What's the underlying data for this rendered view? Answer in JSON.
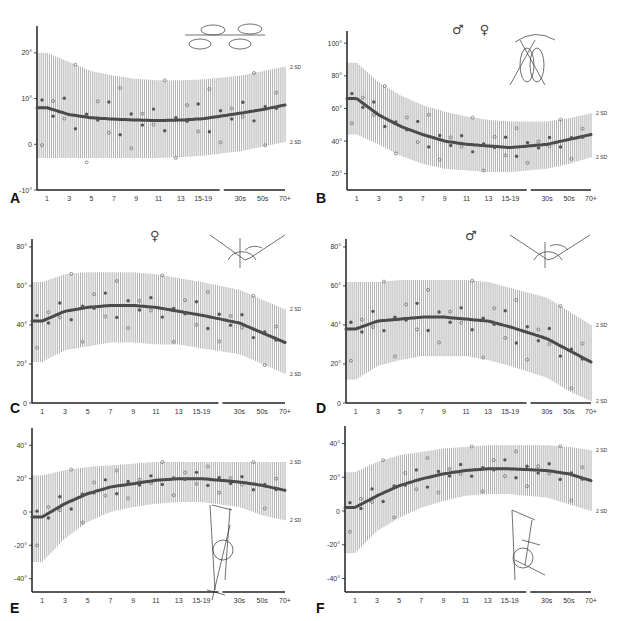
{
  "figure": {
    "x_tick_labels": [
      "1",
      "3",
      "5",
      "7",
      "9",
      "11",
      "13",
      "15-19",
      "30s",
      "50s",
      "70+"
    ],
    "sd_label": "2 SD"
  },
  "panels": [
    {
      "label": "A",
      "symbols": "",
      "illustration": "foot-progression-angle",
      "yticks": [
        {
          "v": 20,
          "t": "20°"
        },
        {
          "v": 10,
          "t": "10°"
        },
        {
          "v": 0,
          "t": "0"
        },
        {
          "v": -10,
          "t": "-10°"
        }
      ]
    },
    {
      "label": "B",
      "symbols": "♂ ♀",
      "illustration": "hip-internal-rotation",
      "yticks": [
        {
          "v": 100,
          "t": "100°"
        },
        {
          "v": 80,
          "t": "80°"
        },
        {
          "v": 60,
          "t": "60°"
        },
        {
          "v": 40,
          "t": "40°"
        },
        {
          "v": 20,
          "t": "20°"
        }
      ]
    },
    {
      "label": "C",
      "symbols": "♀",
      "illustration": "hip-external-rotation",
      "yticks": [
        {
          "v": 80,
          "t": "80°"
        },
        {
          "v": 60,
          "t": "60°"
        },
        {
          "v": 40,
          "t": "40°"
        },
        {
          "v": 20,
          "t": "20°"
        },
        {
          "v": 0,
          "t": "0"
        }
      ]
    },
    {
      "label": "D",
      "symbols": "♂",
      "illustration": "hip-external-rotation",
      "yticks": [
        {
          "v": 80,
          "t": "80°"
        },
        {
          "v": 60,
          "t": "60°"
        },
        {
          "v": 40,
          "t": "40°"
        },
        {
          "v": 20,
          "t": "20°"
        },
        {
          "v": 0,
          "t": "0"
        }
      ]
    },
    {
      "label": "E",
      "symbols": "",
      "illustration": "thigh-foot-angle",
      "yticks": [
        {
          "v": 40,
          "t": "40°"
        },
        {
          "v": 20,
          "t": "20°"
        },
        {
          "v": 0,
          "t": "0"
        },
        {
          "v": -20,
          "t": "-20°"
        },
        {
          "v": -40,
          "t": "-40°"
        }
      ]
    },
    {
      "label": "F",
      "symbols": "",
      "illustration": "transmalleolar-axis",
      "yticks": [
        {
          "v": 40,
          "t": "40°"
        },
        {
          "v": 20,
          "t": "20°"
        },
        {
          "v": 0,
          "t": "0"
        },
        {
          "v": -20,
          "t": "-20°"
        },
        {
          "v": -40,
          "t": "-40°"
        }
      ]
    }
  ],
  "chart_data": [
    {
      "type": "line",
      "title": "A",
      "xlabel": "Age (years)",
      "ylabel": "Degrees",
      "categories": [
        "1",
        "3",
        "5",
        "7",
        "9",
        "11",
        "13",
        "15-19",
        "30s",
        "50s",
        "70+"
      ],
      "ylim": [
        -10,
        25
      ],
      "series": [
        {
          "name": "mean",
          "values": [
            8,
            6.5,
            5.8,
            5.5,
            5.3,
            5.2,
            5.3,
            5.6,
            6.8,
            7.6,
            8.6
          ]
        },
        {
          "name": "+2 SD",
          "values": [
            20,
            18,
            16,
            15,
            14.3,
            14,
            14,
            14.2,
            15,
            16,
            17
          ]
        },
        {
          "name": "-2 SD",
          "values": [
            -3,
            -3,
            -3,
            -3,
            -3,
            -3,
            -2.8,
            -2.5,
            -1.5,
            -0.5,
            0.5
          ]
        }
      ],
      "annotations": [
        "2 SD",
        "2 SD"
      ]
    },
    {
      "type": "line",
      "title": "B",
      "xlabel": "Age (years)",
      "ylabel": "Degrees",
      "categories": [
        "1",
        "3",
        "5",
        "7",
        "9",
        "11",
        "13",
        "15-19",
        "30s",
        "50s",
        "70+"
      ],
      "ylim": [
        10,
        105
      ],
      "series": [
        {
          "name": "mean",
          "values": [
            66,
            56,
            49,
            44,
            40,
            38,
            37,
            36,
            38,
            41,
            44
          ]
        },
        {
          "name": "+2 SD",
          "values": [
            88,
            76,
            68,
            62,
            58,
            55,
            53,
            52,
            52,
            54,
            57
          ]
        },
        {
          "name": "-2 SD",
          "values": [
            44,
            38,
            31,
            26,
            23,
            22,
            21,
            21,
            23,
            26,
            30
          ]
        }
      ],
      "legend": [
        "male",
        "female"
      ],
      "annotations": [
        "2 SD",
        "2 SD"
      ]
    },
    {
      "type": "line",
      "title": "C",
      "xlabel": "Age (years)",
      "ylabel": "Degrees",
      "categories": [
        "1",
        "3",
        "5",
        "7",
        "9",
        "11",
        "13",
        "15-19",
        "30s",
        "50s",
        "70+"
      ],
      "ylim": [
        0,
        82
      ],
      "series": [
        {
          "name": "mean",
          "values": [
            42,
            47,
            49,
            50,
            50,
            49,
            47,
            45,
            41,
            36,
            31
          ]
        },
        {
          "name": "+2 SD",
          "values": [
            62,
            66,
            67,
            67,
            67,
            66,
            64,
            62,
            58,
            53,
            48
          ]
        },
        {
          "name": "-2 SD",
          "values": [
            21,
            27,
            29,
            31,
            31,
            30,
            30,
            28,
            25,
            20,
            15
          ]
        }
      ],
      "legend": [
        "female"
      ],
      "annotations": [
        "2 SD",
        "2 SD"
      ]
    },
    {
      "type": "line",
      "title": "D",
      "xlabel": "Age (years)",
      "ylabel": "Degrees",
      "categories": [
        "1",
        "3",
        "5",
        "7",
        "9",
        "11",
        "13",
        "15-19",
        "30s",
        "50s",
        "70+"
      ],
      "ylim": [
        0,
        82
      ],
      "series": [
        {
          "name": "mean",
          "values": [
            38,
            42,
            43,
            44,
            44,
            43,
            42,
            39,
            33,
            27,
            21
          ]
        },
        {
          "name": "+2 SD",
          "values": [
            62,
            62,
            63,
            63,
            63,
            63,
            62,
            59,
            54,
            47,
            40
          ]
        },
        {
          "name": "-2 SD",
          "values": [
            12,
            19,
            22,
            24,
            24,
            24,
            22,
            19,
            13,
            6,
            1
          ]
        }
      ],
      "legend": [
        "male"
      ],
      "annotations": [
        "2 SD",
        "2 SD"
      ]
    },
    {
      "type": "line",
      "title": "E",
      "xlabel": "Age (years)",
      "ylabel": "Degrees",
      "categories": [
        "1",
        "3",
        "5",
        "7",
        "9",
        "11",
        "13",
        "15-19",
        "30s",
        "50s",
        "70+"
      ],
      "ylim": [
        -48,
        48
      ],
      "series": [
        {
          "name": "mean",
          "values": [
            -3,
            5,
            11,
            15,
            17,
            19,
            20,
            20,
            18,
            16,
            13
          ]
        },
        {
          "name": "+2 SD",
          "values": [
            22,
            25,
            27,
            28,
            29,
            30,
            30,
            30,
            30,
            30,
            30
          ]
        },
        {
          "name": "-2 SD",
          "values": [
            -30,
            -16,
            -6,
            0,
            3,
            5,
            6,
            6,
            3,
            -2,
            -5
          ]
        }
      ],
      "annotations": [
        "2 SD",
        "2 SD"
      ]
    },
    {
      "type": "line",
      "title": "F",
      "xlabel": "Age (years)",
      "ylabel": "Degrees",
      "categories": [
        "1",
        "3",
        "5",
        "7",
        "9",
        "11",
        "13",
        "15-19",
        "30s",
        "50s",
        "70+"
      ],
      "ylim": [
        -48,
        48
      ],
      "series": [
        {
          "name": "mean",
          "values": [
            2,
            9,
            15,
            19,
            22,
            24,
            25,
            25,
            24,
            22,
            18
          ]
        },
        {
          "name": "+2 SD",
          "values": [
            23,
            29,
            33,
            35,
            37,
            38,
            39,
            39,
            39,
            38,
            36
          ]
        },
        {
          "name": "-2 SD",
          "values": [
            -25,
            -12,
            -4,
            2,
            6,
            9,
            10,
            10,
            8,
            4,
            0
          ]
        }
      ],
      "annotations": [
        "2 SD",
        "2 SD"
      ]
    }
  ]
}
